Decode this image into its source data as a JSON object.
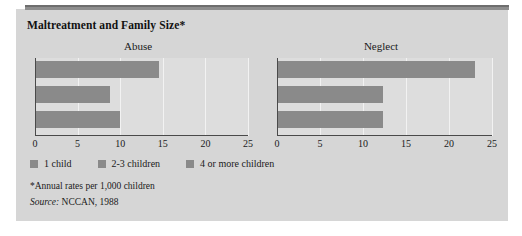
{
  "figure": {
    "title": "Maltreatment and Family Size*",
    "footnote": "*Annual rates per 1,000 children",
    "source_label": "Source:",
    "source_value": " NCCAN, 1988",
    "bar_color": "#8a8a8a",
    "panel_color": "#d6d6d6",
    "plot_color": "#dddddd",
    "axis_color": "#4a4a4a"
  },
  "legend": {
    "items": [
      {
        "label": "1 child",
        "color": "#8a8a8a"
      },
      {
        "label": "2-3 children",
        "color": "#8a8a8a"
      },
      {
        "label": "4 or more children",
        "color": "#8a8a8a"
      }
    ]
  },
  "chart_data": [
    {
      "type": "bar",
      "orientation": "horizontal",
      "title": "Abuse",
      "categories": [
        "1 child",
        "2-3 children",
        "4 or more children"
      ],
      "values": [
        14.6,
        8.8,
        10.0
      ],
      "xlabel": "",
      "ylabel": "",
      "xlim": [
        0,
        25
      ],
      "xticks": [
        0,
        5,
        10,
        15,
        20,
        25
      ],
      "ticklabels": [
        "0",
        "5",
        "10",
        "15",
        "20",
        "25"
      ],
      "grid": true,
      "legend_position": "bottom"
    },
    {
      "type": "bar",
      "orientation": "horizontal",
      "title": "Neglect",
      "categories": [
        "1 child",
        "2-3 children",
        "4 or more children"
      ],
      "values": [
        23.0,
        12.3,
        12.3
      ],
      "xlabel": "",
      "ylabel": "",
      "xlim": [
        0,
        25
      ],
      "xticks": [
        0,
        5,
        10,
        15,
        20,
        25
      ],
      "ticklabels": [
        "0",
        "5",
        "10",
        "15",
        "20",
        "25"
      ],
      "grid": true,
      "legend_position": "bottom"
    }
  ]
}
